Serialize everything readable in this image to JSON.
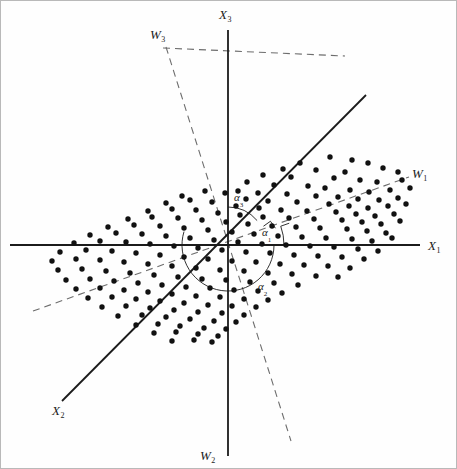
{
  "figure": {
    "width": 457,
    "height": 469,
    "background": "#fefefe",
    "border_color": "#b9b9b9",
    "ink_color": "#1b1b1b",
    "dash_color": "#6d6d6d",
    "point_color": "#111111"
  },
  "chart_data": {
    "type": "scatter",
    "title": "",
    "subtitle": "",
    "xlabel": "",
    "ylabel": "",
    "grid": false,
    "legend": null,
    "origin": {
      "x": 228,
      "y": 245
    },
    "axis_ranges": {
      "xlim": [
        0,
        457
      ],
      "ylim": [
        0,
        469
      ]
    },
    "original_axes": [
      {
        "name": "X1",
        "label": "X",
        "sub": "1",
        "style": "solid",
        "x1": 10,
        "y1": 245,
        "x2": 420,
        "y2": 245,
        "label_x": 428,
        "label_y": 239
      },
      {
        "name": "X2",
        "label": "X",
        "sub": "2",
        "style": "solid",
        "x1": 62,
        "y1": 401,
        "x2": 366,
        "y2": 95,
        "label_x": 52,
        "label_y": 404
      },
      {
        "name": "X3",
        "label": "X",
        "sub": "3",
        "style": "solid",
        "x1": 228,
        "y1": 30,
        "x2": 228,
        "y2": 456,
        "label_x": 219,
        "label_y": 8
      }
    ],
    "principal_axes": [
      {
        "name": "W1",
        "label": "W",
        "sub": "1",
        "style": "dashed",
        "x1": 33,
        "y1": 311,
        "x2": 409,
        "y2": 177,
        "label_x": 412,
        "label_y": 167
      },
      {
        "name": "W2",
        "label": "W",
        "sub": "2",
        "style": "dashed",
        "x1": 166,
        "y1": 47,
        "x2": 291,
        "y2": 441,
        "label_x": 200,
        "label_y": 449
      },
      {
        "name": "W3",
        "label": "W",
        "sub": "3",
        "style": "dashed",
        "x1": 163,
        "y1": 48,
        "x2": 345,
        "y2": 56,
        "label_x": 150,
        "label_y": 28
      }
    ],
    "angles": [
      {
        "name": "alpha1",
        "label": "α",
        "sub": "1",
        "description": "angle between X1 axis and W1 axis",
        "radius": 56,
        "start_deg": 0,
        "end_deg": 19.6,
        "label_x": 262,
        "label_y": 227,
        "tick": true
      },
      {
        "name": "alpha2",
        "label": "α",
        "sub": "2",
        "description": "angle measured clockwise from X1 axis around to W2 axis",
        "radius": 46,
        "start_deg": 0,
        "end_deg": -197,
        "label_x": 258,
        "label_y": 281,
        "tick": false
      },
      {
        "name": "alpha3",
        "label": "α",
        "sub": "3",
        "description": "angle between X3 axis and W3 axis near the vertical",
        "radius": 38,
        "start_deg": 90,
        "end_deg": 40,
        "label_x": 234,
        "label_y": 192,
        "tick": false
      }
    ],
    "points": [
      [
        330,
        157
      ],
      [
        352,
        160
      ],
      [
        368,
        163
      ],
      [
        300,
        163
      ],
      [
        283,
        169
      ],
      [
        316,
        170
      ],
      [
        345,
        172
      ],
      [
        383,
        168
      ],
      [
        398,
        172
      ],
      [
        263,
        175
      ],
      [
        291,
        177
      ],
      [
        334,
        178
      ],
      [
        360,
        180
      ],
      [
        377,
        182
      ],
      [
        402,
        180
      ],
      [
        247,
        182
      ],
      [
        274,
        185
      ],
      [
        308,
        186
      ],
      [
        325,
        188
      ],
      [
        350,
        190
      ],
      [
        369,
        192
      ],
      [
        390,
        190
      ],
      [
        410,
        188
      ],
      [
        238,
        191
      ],
      [
        258,
        193
      ],
      [
        287,
        194
      ],
      [
        316,
        196
      ],
      [
        338,
        197
      ],
      [
        358,
        199
      ],
      [
        379,
        200
      ],
      [
        398,
        198
      ],
      [
        182,
        196
      ],
      [
        205,
        191
      ],
      [
        225,
        193
      ],
      [
        246,
        199
      ],
      [
        268,
        201
      ],
      [
        297,
        202
      ],
      [
        329,
        204
      ],
      [
        349,
        206
      ],
      [
        368,
        208
      ],
      [
        388,
        206
      ],
      [
        406,
        204
      ],
      [
        166,
        203
      ],
      [
        190,
        200
      ],
      [
        212,
        202
      ],
      [
        236,
        206
      ],
      [
        259,
        208
      ],
      [
        281,
        210
      ],
      [
        307,
        211
      ],
      [
        336,
        212
      ],
      [
        356,
        214
      ],
      [
        375,
        216
      ],
      [
        394,
        214
      ],
      [
        148,
        211
      ],
      [
        172,
        209
      ],
      [
        196,
        210
      ],
      [
        218,
        213
      ],
      [
        240,
        215
      ],
      [
        263,
        217
      ],
      [
        289,
        218
      ],
      [
        314,
        219
      ],
      [
        342,
        220
      ],
      [
        362,
        222
      ],
      [
        381,
        224
      ],
      [
        400,
        221
      ],
      [
        128,
        219
      ],
      [
        152,
        217
      ],
      [
        178,
        218
      ],
      [
        202,
        220
      ],
      [
        226,
        222
      ],
      [
        248,
        224
      ],
      [
        272,
        226
      ],
      [
        296,
        227
      ],
      [
        320,
        228
      ],
      [
        347,
        229
      ],
      [
        367,
        231
      ],
      [
        386,
        233
      ],
      [
        108,
        227
      ],
      [
        134,
        225
      ],
      [
        160,
        226
      ],
      [
        184,
        228
      ],
      [
        208,
        230
      ],
      [
        232,
        232
      ],
      [
        254,
        234
      ],
      [
        278,
        236
      ],
      [
        302,
        237
      ],
      [
        326,
        238
      ],
      [
        352,
        239
      ],
      [
        372,
        241
      ],
      [
        392,
        238
      ],
      [
        90,
        235
      ],
      [
        116,
        233
      ],
      [
        142,
        234
      ],
      [
        166,
        236
      ],
      [
        190,
        238
      ],
      [
        214,
        240
      ],
      [
        238,
        242
      ],
      [
        262,
        244
      ],
      [
        286,
        245
      ],
      [
        310,
        246
      ],
      [
        334,
        247
      ],
      [
        358,
        249
      ],
      [
        378,
        251
      ],
      [
        74,
        243
      ],
      [
        100,
        241
      ],
      [
        126,
        242
      ],
      [
        150,
        244
      ],
      [
        174,
        246
      ],
      [
        198,
        248
      ],
      [
        222,
        250
      ],
      [
        246,
        252
      ],
      [
        270,
        253
      ],
      [
        294,
        255
      ],
      [
        318,
        256
      ],
      [
        342,
        257
      ],
      [
        364,
        259
      ],
      [
        60,
        252
      ],
      [
        86,
        250
      ],
      [
        112,
        251
      ],
      [
        136,
        253
      ],
      [
        160,
        255
      ],
      [
        184,
        257
      ],
      [
        208,
        259
      ],
      [
        232,
        261
      ],
      [
        256,
        262
      ],
      [
        280,
        264
      ],
      [
        304,
        265
      ],
      [
        328,
        266
      ],
      [
        350,
        268
      ],
      [
        52,
        261
      ],
      [
        76,
        259
      ],
      [
        100,
        260
      ],
      [
        124,
        262
      ],
      [
        148,
        264
      ],
      [
        172,
        266
      ],
      [
        196,
        268
      ],
      [
        220,
        270
      ],
      [
        244,
        271
      ],
      [
        268,
        273
      ],
      [
        292,
        274
      ],
      [
        316,
        276
      ],
      [
        338,
        277
      ],
      [
        58,
        270
      ],
      [
        82,
        269
      ],
      [
        106,
        271
      ],
      [
        130,
        273
      ],
      [
        154,
        275
      ],
      [
        178,
        277
      ],
      [
        202,
        279
      ],
      [
        226,
        280
      ],
      [
        250,
        282
      ],
      [
        274,
        283
      ],
      [
        298,
        285
      ],
      [
        66,
        280
      ],
      [
        90,
        279
      ],
      [
        114,
        281
      ],
      [
        138,
        283
      ],
      [
        162,
        285
      ],
      [
        186,
        287
      ],
      [
        210,
        288
      ],
      [
        234,
        290
      ],
      [
        258,
        291
      ],
      [
        282,
        293
      ],
      [
        76,
        289
      ],
      [
        100,
        288
      ],
      [
        124,
        290
      ],
      [
        148,
        292
      ],
      [
        172,
        294
      ],
      [
        196,
        296
      ],
      [
        220,
        297
      ],
      [
        244,
        299
      ],
      [
        268,
        300
      ],
      [
        88,
        298
      ],
      [
        112,
        297
      ],
      [
        136,
        299
      ],
      [
        160,
        301
      ],
      [
        184,
        303
      ],
      [
        208,
        305
      ],
      [
        232,
        306
      ],
      [
        256,
        307
      ],
      [
        102,
        307
      ],
      [
        126,
        306
      ],
      [
        150,
        308
      ],
      [
        174,
        310
      ],
      [
        198,
        312
      ],
      [
        222,
        313
      ],
      [
        244,
        315
      ],
      [
        118,
        316
      ],
      [
        142,
        315
      ],
      [
        166,
        317
      ],
      [
        190,
        319
      ],
      [
        214,
        321
      ],
      [
        236,
        322
      ],
      [
        136,
        325
      ],
      [
        158,
        324
      ],
      [
        180,
        326
      ],
      [
        204,
        328
      ],
      [
        226,
        329
      ],
      [
        154,
        333
      ],
      [
        176,
        332
      ],
      [
        198,
        334
      ],
      [
        218,
        336
      ],
      [
        172,
        341
      ],
      [
        194,
        340
      ],
      [
        212,
        342
      ]
    ]
  }
}
